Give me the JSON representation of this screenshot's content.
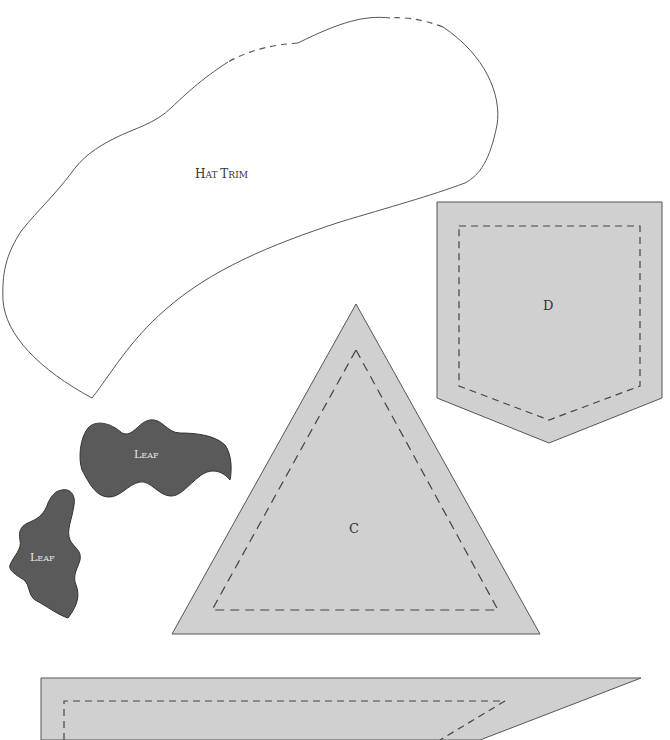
{
  "diagram": {
    "type": "sewing-pattern-sheet",
    "pieces": [
      {
        "id": "hat-trim",
        "label": "Hat Trim",
        "fill": "#ffffff",
        "outline": "solid with dashed segments at top"
      },
      {
        "id": "piece-d",
        "label": "D",
        "fill": "#d0d0d0",
        "seam_allowance": "dashed"
      },
      {
        "id": "leaf-1",
        "label": "Leaf",
        "fill": "#5a5a5a"
      },
      {
        "id": "leaf-2",
        "label": "Leaf",
        "fill": "#5a5a5a"
      },
      {
        "id": "piece-c",
        "label": "C",
        "fill": "#d0d0d0",
        "seam_allowance": "dashed"
      },
      {
        "id": "bottom-piece",
        "label": "",
        "fill": "#d0d0d0",
        "seam_allowance": "dashed",
        "note": "partially cut off at bottom edge"
      }
    ]
  },
  "labels": {
    "hat_trim_a": "H",
    "hat_trim_b": "AT ",
    "hat_trim_c": "T",
    "hat_trim_d": "RIM",
    "d": "D",
    "c": "C",
    "leaf_a": "L",
    "leaf_b": "EAF"
  },
  "colors": {
    "gray_fill": "#d0d0d0",
    "leaf_fill": "#5a5a5a",
    "outline": "#444444",
    "leaf_text": "#e8e8e8"
  }
}
